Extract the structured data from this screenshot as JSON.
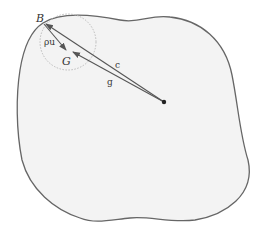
{
  "diagram": {
    "labels": {
      "B": "B",
      "G": "G",
      "rho_u": "ρu",
      "c": "c",
      "g": "g"
    },
    "colors": {
      "region_fill": "#f3f3f3",
      "region_stroke": "#666666",
      "vector": "#555555",
      "circle": "#bbbbbb",
      "dot": "#222222"
    }
  }
}
